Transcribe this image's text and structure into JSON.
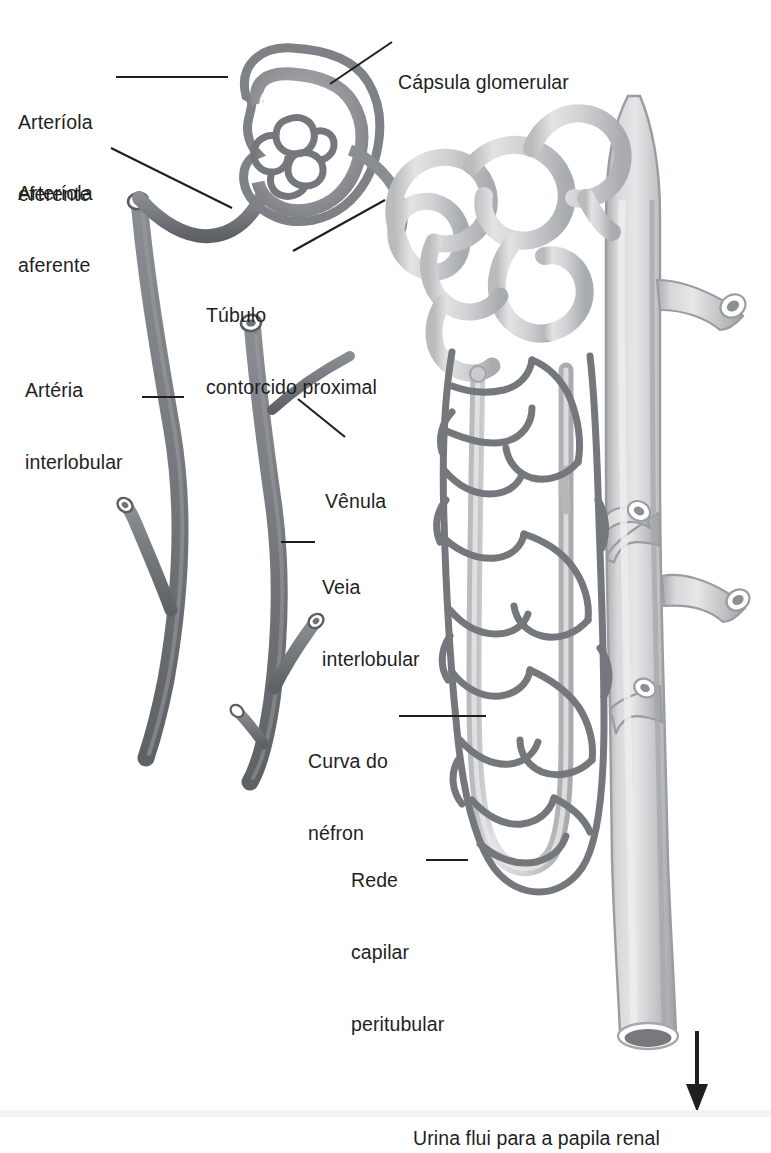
{
  "figure": {
    "language": "pt-BR",
    "background_color": "#ffffff",
    "ink_color": "#1f1f1f"
  },
  "palette": {
    "vessel_dark": "#6f7276",
    "vessel_dark_edge": "#4d5054",
    "vessel_mid": "#8b8e92",
    "tubule_light": "#c9cbcd",
    "tubule_light_edge": "#9a9da1",
    "capsule_gray": "#9b9ea2",
    "duct_light": "#c6c8ca",
    "duct_edge": "#9fa2a5",
    "leader_line": "#1f1f1f",
    "white": "#ffffff"
  },
  "labels": [
    {
      "id": "capsula-glomerular",
      "lines": [
        "Cápsula glomerular"
      ],
      "x": 398,
      "y": 22,
      "anchor": "start",
      "leader": {
        "from": [
          392,
          42
        ],
        "to": [
          330,
          84
        ]
      }
    },
    {
      "id": "arteriola-eferente",
      "lines": [
        "Arteríola",
        "eferente"
      ],
      "x": 18,
      "y": 62,
      "anchor": "start",
      "leader": {
        "from": [
          116,
          77
        ],
        "to": [
          228,
          77
        ]
      }
    },
    {
      "id": "arteriola-aferente",
      "lines": [
        "Arteríola",
        "aferente"
      ],
      "x": 18,
      "y": 133,
      "anchor": "start",
      "leader": {
        "from": [
          111,
          148
        ],
        "to": [
          232,
          208
        ]
      }
    },
    {
      "id": "tubulo-contorcido-proximal",
      "lines": [
        "Túbulo",
        "contorcido proximal"
      ],
      "x": 206,
      "y": 255,
      "anchor": "start",
      "leader": {
        "from": [
          293,
          251
        ],
        "to": [
          385,
          200
        ]
      }
    },
    {
      "id": "arteria-interlobular",
      "lines": [
        "Artéria",
        "interlobular"
      ],
      "x": 25,
      "y": 330,
      "anchor": "start",
      "leader": {
        "from": [
          142,
          397
        ],
        "to": [
          182,
          397
        ]
      }
    },
    {
      "id": "venula",
      "lines": [
        "Vênula"
      ],
      "x": 325,
      "y": 441,
      "anchor": "start",
      "leader": {
        "from": [
          345,
          437
        ],
        "to": [
          298,
          399
        ]
      }
    },
    {
      "id": "veia-interlobular",
      "lines": [
        "Veia",
        "interlobular"
      ],
      "x": 322,
      "y": 527,
      "anchor": "start",
      "leader": {
        "from": [
          315,
          542
        ],
        "to": [
          283,
          542
        ]
      }
    },
    {
      "id": "curva-do-nefron",
      "lines": [
        "Curva do",
        "néfron"
      ],
      "x": 308,
      "y": 701,
      "anchor": "start",
      "leader": {
        "from": [
          399,
          716
        ],
        "to": [
          485,
          716
        ]
      }
    },
    {
      "id": "rede-capilar-peritubular",
      "lines": [
        "Rede",
        "capilar",
        "peritubular"
      ],
      "x": 351,
      "y": 820,
      "anchor": "start",
      "leader": {
        "from": [
          426,
          860
        ],
        "to": [
          466,
          860
        ]
      }
    },
    {
      "id": "urina-flui-para-a-papila-renal",
      "lines": [
        "Urina flui para a papila renal"
      ],
      "x": 413,
      "y": 1078,
      "anchor": "start",
      "leader": null
    }
  ],
  "flow_arrow": {
    "name": "urine-flow-arrow",
    "from": [
      697,
      1031
    ],
    "to": [
      697,
      1110
    ],
    "direction": "down"
  },
  "structures": [
    {
      "id": "glomerular-capsule",
      "label": "Cápsula glomerular"
    },
    {
      "id": "glomerulus",
      "label": "Glomérulo"
    },
    {
      "id": "afferent-arteriole",
      "label": "Arteríola aferente"
    },
    {
      "id": "efferent-arteriole",
      "label": "Arteríola eferente"
    },
    {
      "id": "proximal-convoluted-tubule",
      "label": "Túbulo contorcido proximal"
    },
    {
      "id": "interlobular-artery",
      "label": "Artéria interlobular"
    },
    {
      "id": "interlobular-vein",
      "label": "Veia interlobular"
    },
    {
      "id": "venule",
      "label": "Vênula"
    },
    {
      "id": "nephron-loop",
      "label": "Curva do néfron"
    },
    {
      "id": "peritubular-capillary-network",
      "label": "Rede capilar peritubular"
    },
    {
      "id": "collecting-duct",
      "label": "Ducto coletor"
    }
  ]
}
